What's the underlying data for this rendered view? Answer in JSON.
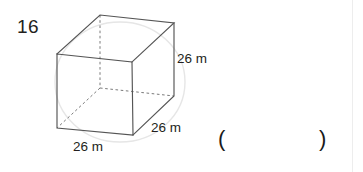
{
  "page": {
    "width": 363,
    "height": 172,
    "background": "#ffffff",
    "ink_color": "#231f20",
    "watermark_color": "#e3e3e3"
  },
  "problem": {
    "number": "16",
    "shape": "cube"
  },
  "figure": {
    "type": "cube-isometric-wireframe",
    "solid_edge_color": "#4d4d4d",
    "hidden_edge_color": "#777777",
    "hidden_edge_style": "dashed",
    "vertices": {
      "front_top_left": [
        57,
        54
      ],
      "front_top_right": [
        132,
        62
      ],
      "front_bottom_left": [
        57,
        128
      ],
      "front_bottom_right": [
        133,
        135
      ],
      "back_top_left": [
        100,
        15
      ],
      "back_top_right": [
        174,
        23
      ],
      "back_bottom_left": [
        100,
        88
      ],
      "back_bottom_right": [
        174,
        96
      ]
    },
    "labels": [
      {
        "name": "height",
        "text": "26 m"
      },
      {
        "name": "depth",
        "text": "26 m"
      },
      {
        "name": "width",
        "text": "26 m"
      }
    ]
  },
  "answer": {
    "paren_open": "(",
    "paren_close": ")",
    "value": ""
  }
}
